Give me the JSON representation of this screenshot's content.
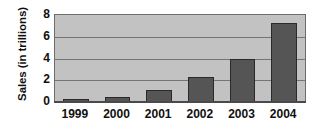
{
  "chart_data": {
    "type": "bar",
    "title": "",
    "xlabel": "",
    "ylabel": "Sales (in trillions)",
    "categories": [
      "1999",
      "2000",
      "2001",
      "2002",
      "2003",
      "2004"
    ],
    "values": [
      0.25,
      0.45,
      1.1,
      2.3,
      4.0,
      7.3
    ],
    "series": [
      {
        "name": "Sales",
        "values": [
          0.25,
          0.45,
          1.1,
          2.3,
          4.0,
          7.3
        ]
      }
    ],
    "ylim": [
      0,
      8
    ],
    "yticks": [
      0,
      2,
      4,
      6,
      8
    ],
    "ytick_labels": [
      "0",
      "2",
      "4",
      "6",
      "8"
    ],
    "gridlines": [
      2,
      4,
      6
    ],
    "grid": true,
    "legend": "none",
    "colors": {
      "bar_fill": "#555555",
      "bar_edge": "#2a2a2a",
      "plot_background": "#c2c2c2",
      "gridline": "#757575",
      "axis": "#4a4a4a",
      "text": "#101010",
      "figure_background": "#ffffff"
    }
  }
}
